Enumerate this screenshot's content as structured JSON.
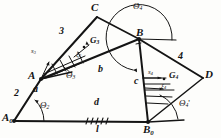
{
  "figure": {
    "background_color": "#fdfdfb",
    "ink_color": "#141414"
  },
  "joints": [
    {
      "name": "A0",
      "label": "A",
      "subscript": "0",
      "x": 14,
      "y": 120
    },
    {
      "name": "A",
      "label": "A",
      "subscript": "",
      "x": 41,
      "y": 78
    },
    {
      "name": "C",
      "label": "C",
      "subscript": "",
      "x": 96,
      "y": 12
    },
    {
      "name": "B",
      "label": "B",
      "subscript": "",
      "x": 139,
      "y": 37
    },
    {
      "name": "D",
      "label": "D",
      "subscript": "",
      "x": 205,
      "y": 77
    },
    {
      "name": "B0",
      "label": "B",
      "subscript": "0",
      "x": 148,
      "y": 122
    }
  ],
  "link_numbers": [
    {
      "name": "link-2",
      "label": "2",
      "x": 18,
      "y": 94
    },
    {
      "name": "link-3",
      "label": "3",
      "x": 62,
      "y": 32
    },
    {
      "name": "link-4",
      "label": "4",
      "x": 180,
      "y": 57
    }
  ],
  "dimensions": [
    {
      "name": "dim-a",
      "label": "a",
      "x": 36,
      "y": 90
    },
    {
      "name": "dim-b",
      "label": "b",
      "x": 100,
      "y": 70
    },
    {
      "name": "dim-c",
      "label": "c",
      "x": 137,
      "y": 81
    },
    {
      "name": "dim-d",
      "label": "d",
      "x": 96,
      "y": 103
    },
    {
      "name": "dim-l",
      "label": "l",
      "x": 98,
      "y": 127
    }
  ],
  "angles": [
    {
      "name": "theta-2",
      "label": "Θ",
      "subscript": "2",
      "prime": "",
      "x": 43,
      "y": 106
    },
    {
      "name": "theta-3",
      "label": "Θ",
      "subscript": "3",
      "prime": "",
      "x": 70,
      "y": 76
    },
    {
      "name": "theta-4",
      "label": "Θ",
      "subscript": "4",
      "prime": "",
      "x": 137,
      "y": 8
    },
    {
      "name": "theta-4-prime",
      "label": "Θ",
      "subscript": "4",
      "prime": "'",
      "x": 182,
      "y": 104
    }
  ],
  "centers_of_gravity": [
    {
      "name": "cg-G3",
      "label": "G",
      "subscript": "3",
      "x": 92,
      "y": 41
    },
    {
      "name": "cg-G4",
      "label": "G",
      "subscript": "4",
      "x": 172,
      "y": 76
    }
  ],
  "offsets": [
    {
      "name": "offset-s3",
      "label": "s",
      "subscript": "3",
      "x": 33,
      "y": 52
    },
    {
      "name": "offset-xi3",
      "label": "ξ",
      "subscript": "3",
      "x": 78,
      "y": 55
    },
    {
      "name": "offset-s4",
      "label": "s",
      "subscript": "4",
      "x": 150,
      "y": 73
    },
    {
      "name": "offset-xi4",
      "label": "ξ",
      "subscript": "4",
      "x": 163,
      "y": 88
    }
  ]
}
